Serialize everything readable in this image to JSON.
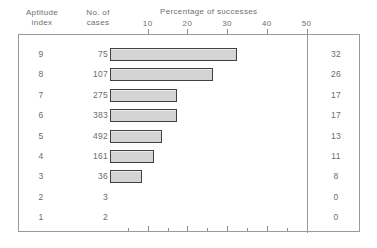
{
  "figure": {
    "columns": {
      "aptitude_header": "Aptitude\nindex",
      "cases_header": "No. of\ncases"
    },
    "axis_title": "Percentage of successes",
    "axis_ticks": [
      "10",
      "20",
      "30",
      "40",
      "50"
    ],
    "rows": [
      {
        "index": "9",
        "cases": "75",
        "percent": "32"
      },
      {
        "index": "8",
        "cases": "107",
        "percent": "26"
      },
      {
        "index": "7",
        "cases": "275",
        "percent": "17"
      },
      {
        "index": "6",
        "cases": "383",
        "percent": "17"
      },
      {
        "index": "5",
        "cases": "492",
        "percent": "13"
      },
      {
        "index": "4",
        "cases": "161",
        "percent": "11"
      },
      {
        "index": "3",
        "cases": "36",
        "percent": "8"
      },
      {
        "index": "2",
        "cases": "3",
        "percent": "0"
      },
      {
        "index": "1",
        "cases": "2",
        "percent": "0"
      }
    ]
  },
  "chart_data": {
    "type": "bar",
    "orientation": "horizontal",
    "title": "Percentage of successes",
    "xlabel": "Percentage of successes",
    "ylabel": "Aptitude index",
    "categories": [
      "9",
      "8",
      "7",
      "6",
      "5",
      "4",
      "3",
      "2",
      "1"
    ],
    "values": [
      32,
      26,
      17,
      17,
      13,
      11,
      8,
      0,
      0
    ],
    "series": [
      {
        "name": "Percentage of successes",
        "values": [
          32,
          26,
          17,
          17,
          13,
          11,
          8,
          0,
          0
        ]
      },
      {
        "name": "No. of cases",
        "values": [
          75,
          107,
          275,
          383,
          492,
          161,
          36,
          3,
          2
        ]
      }
    ],
    "xlim": [
      0,
      50
    ],
    "xticks": [
      10,
      20,
      30,
      40,
      50
    ],
    "grid": false,
    "legend": "none",
    "bar_fill_color": "#d4d4d4",
    "bar_border_color": "#404040",
    "frame_color": "#9a9a9a",
    "text_color": "#6b6b6b"
  }
}
